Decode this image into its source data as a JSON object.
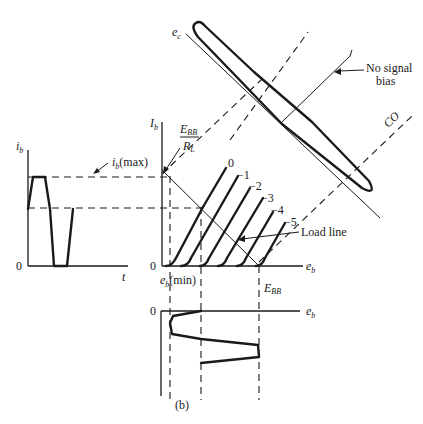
{
  "figure": {
    "caption": "(b)",
    "left_plot": {
      "y_axis_label_main": "i",
      "y_axis_label_sub": "b",
      "x_axis_label": "t",
      "origin_label": "0",
      "annotation_main": "i",
      "annotation_sub": "b",
      "annotation_suffix": "(max)"
    },
    "main_plot": {
      "y_axis_label_main": "I",
      "y_axis_label_sub": "b",
      "x_axis_label_main": "e",
      "x_axis_label_sub": "b",
      "origin_label": "0",
      "intercept_label_num_main": "E",
      "intercept_label_num_sub": "BB",
      "intercept_label_den_main": "R",
      "intercept_label_den_sub": "L",
      "curve_labels": [
        "0",
        "−1",
        "−2",
        "−3",
        "−4",
        "−5"
      ],
      "load_line_label": "Load line",
      "emin_label_main": "e",
      "emin_label_sub": "b",
      "emin_label_suffix": "(min)",
      "ebb_label_main": "E",
      "ebb_label_sub": "BB"
    },
    "bottom_plot": {
      "origin_label": "0",
      "x_axis_label_main": "e",
      "x_axis_label_sub": "b"
    },
    "grid_signal": {
      "axis_label_main": "e",
      "axis_label_sub": "c",
      "no_signal_bias_line1": "No signal",
      "no_signal_bias_line2": "bias",
      "cutoff_label": "CO"
    }
  }
}
